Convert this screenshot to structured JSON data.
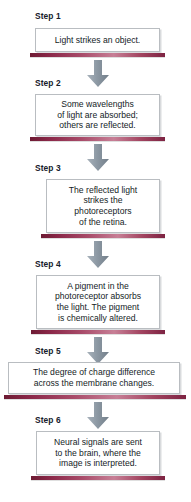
{
  "diagram": {
    "orientation": "vertical",
    "accent_bar_color": "#7d2342",
    "arrow_color": "#8e9aa4",
    "box_border_color": "#b9bdc1",
    "background_color": "#ffffff",
    "text_color": "#141c26"
  },
  "steps": [
    {
      "label": "Step 1",
      "text": "Light strikes an object."
    },
    {
      "label": "Step 2",
      "text": "Some wavelengths\nof light are absorbed;\nothers are reflected."
    },
    {
      "label": "Step 3",
      "text": "The reflected light\nstrikes the\nphotoreceptors\nof  the retina."
    },
    {
      "label": "Step 4",
      "text": "A pigment in the\nphotoreceptor absorbs\nthe light. The pigment\nis chemically altered."
    },
    {
      "label": "Step 5",
      "text": "The degree of charge difference\nacross the membrane changes."
    },
    {
      "label": "Step 6",
      "text": "Neural signals are sent\nto the brain, where the\nimage is interpreted."
    }
  ],
  "arrows": [
    {
      "name": "arrow-step1-to-step2"
    },
    {
      "name": "arrow-step2-to-step3"
    },
    {
      "name": "arrow-step3-to-step4"
    },
    {
      "name": "arrow-step4-to-step5"
    },
    {
      "name": "arrow-step5-to-step6"
    }
  ]
}
